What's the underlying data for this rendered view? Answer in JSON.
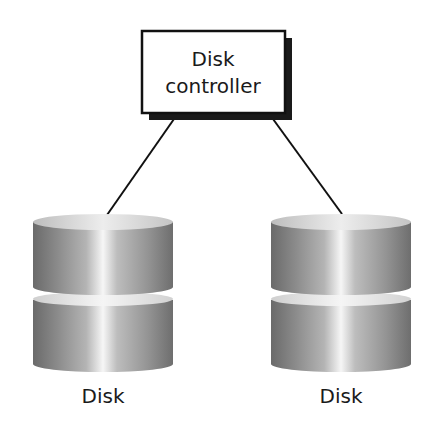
{
  "diagram": {
    "controller": {
      "line1": "Disk",
      "line2": "controller"
    },
    "disks": [
      {
        "label": "Disk"
      },
      {
        "label": "Disk"
      }
    ],
    "colors": {
      "stroke": "#111111",
      "shadow": "#1a1a1a",
      "disk_dark": "#6e6e6e",
      "disk_mid": "#a9a9a9",
      "disk_light": "#f4f4f4"
    }
  }
}
